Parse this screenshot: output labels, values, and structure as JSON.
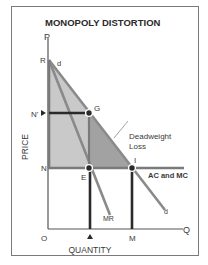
{
  "title": "MONOPOLY DISTORTION",
  "axes": {
    "y_label": "PRICE",
    "x_label": "QUANTITY",
    "y_axis_letter": "P",
    "x_axis_letter": "Q",
    "origin": "O"
  },
  "points": {
    "R": "R",
    "N_prime": "N'",
    "N": "N",
    "G": "G",
    "E": "E",
    "I": "I",
    "M": "M"
  },
  "curves": {
    "demand_top": "d",
    "demand_bottom": "d",
    "marginal_revenue": "MR",
    "cost": "AC and MC"
  },
  "annotations": {
    "deadweight_line1": "Deadweight",
    "deadweight_line2": "Loss"
  },
  "colors": {
    "light_shade": "#c8c8c8",
    "dark_shade": "#a0a0a0",
    "curve": "#8a8a8a",
    "dark_line": "#2a2a2a",
    "axis": "#555555"
  }
}
